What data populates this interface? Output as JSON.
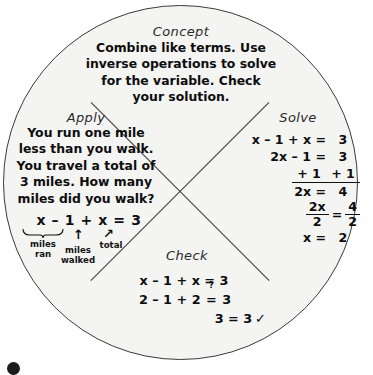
{
  "figure": {
    "kind": "four-quadrant-concept-wheel",
    "shape": "circle",
    "fill_color": "#f4f4f3",
    "line_color": "#3a3a3a"
  },
  "concept": {
    "heading": "Concept",
    "lines": [
      "Combine like terms. Use",
      "inverse operations to solve",
      "for the variable. Check",
      "your solution."
    ]
  },
  "apply": {
    "heading": "Apply",
    "lines": [
      "You run one mile",
      "less than you walk.",
      "You travel a total of",
      "3 miles. How many",
      "miles did you walk?"
    ],
    "equation": "x – 1 + x = 3",
    "annotations": {
      "braced_term_label_line1": "miles",
      "braced_term_label_line2": "ran",
      "arrow1_label_line1": "miles",
      "arrow1_label_line2": "walked",
      "arrow2_label": "total",
      "arrow_glyph": "↑",
      "arrow_glyph_tilted": "↗"
    }
  },
  "solve": {
    "heading": "Solve",
    "rows": [
      {
        "left": "x – 1 + x =",
        "right": "3"
      },
      {
        "left": "2x – 1 =",
        "right": "3"
      },
      {
        "left": "+ 1",
        "right": "+ 1",
        "ruled": true
      },
      {
        "left": "2x =",
        "right": "4"
      },
      {
        "left_num": "2x",
        "left_den": "2",
        "eq": "=",
        "right_num": "4",
        "right_den": "2"
      },
      {
        "left": "x =",
        "right": "2"
      }
    ]
  },
  "check": {
    "heading": "Check",
    "rows": [
      "x – 1 + x = 3",
      "2 – 1 + 2 = 3",
      "3 = 3"
    ],
    "row2_prefix": "2 – 1 + 2 ",
    "row2_relation": "=",
    "row2_relation_superscript": "?",
    "row2_suffix": " 3",
    "row3_text": "3 = 3",
    "row3_checkmark": "✓"
  }
}
